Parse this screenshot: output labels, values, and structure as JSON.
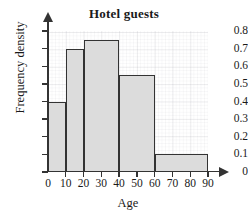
{
  "chart_data": {
    "type": "bar",
    "title": "Hotel guests",
    "xlabel": "Age",
    "ylabel": "Frequency density",
    "grid": true,
    "legend": false,
    "xlim": [
      0,
      90
    ],
    "ylim": [
      0,
      0.8
    ],
    "xticks": [
      "0",
      "10",
      "20",
      "30",
      "40",
      "50",
      "60",
      "70",
      "80",
      "90"
    ],
    "yticks": [
      "0",
      "0.1",
      "0.2",
      "0.3",
      "0.4",
      "0.5",
      "0.6",
      "0.7",
      "0.8"
    ],
    "xtick_values": [
      0,
      10,
      20,
      30,
      40,
      50,
      60,
      70,
      80,
      90
    ],
    "ytick_values": [
      0,
      0.1,
      0.2,
      0.3,
      0.4,
      0.5,
      0.6,
      0.7,
      0.8
    ],
    "bar_color": "#dcdcdc",
    "bar_edge_color": "#333333",
    "bins": [
      {
        "label": "0-10",
        "start": 0,
        "end": 10,
        "value": 0.4
      },
      {
        "label": "10-20",
        "start": 10,
        "end": 20,
        "value": 0.7
      },
      {
        "label": "20-40",
        "start": 20,
        "end": 40,
        "value": 0.75
      },
      {
        "label": "40-60",
        "start": 40,
        "end": 60,
        "value": 0.55
      },
      {
        "label": "60-90",
        "start": 60,
        "end": 90,
        "value": 0.1
      }
    ],
    "categories": [
      "0-10",
      "10-20",
      "20-40",
      "40-60",
      "60-90"
    ],
    "values": [
      0.4,
      0.7,
      0.75,
      0.55,
      0.1
    ]
  }
}
